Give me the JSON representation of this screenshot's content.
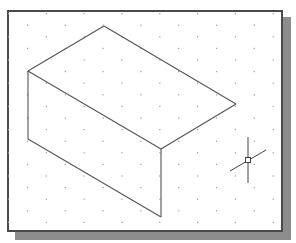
{
  "viewport": {
    "frame": {
      "x": 7,
      "y": 10,
      "width": 276,
      "height": 222,
      "border_color": "#4a4a4a"
    },
    "shadow": {
      "offset_x": 8,
      "offset_y": 7,
      "color": "#8c8c8c"
    },
    "background": "#ffffff"
  },
  "grid": {
    "type": "isometric-snap-grid",
    "origin_x": 8,
    "origin_y": 13,
    "column_spacing": 18.9,
    "row_spacing": 23.2,
    "stagger": 11.6,
    "dot_color": "#9a9a9a"
  },
  "drawing": {
    "object": "isometric-box-wireframe",
    "line_color": "#555555",
    "vertices": {
      "top_back": [
        104,
        26
      ],
      "left_top": [
        28,
        71
      ],
      "right_top": [
        236,
        104
      ],
      "front_top": [
        161,
        149
      ],
      "left_bottom": [
        28,
        139
      ],
      "front_bottom": [
        161,
        217
      ]
    },
    "edges": [
      [
        "left_top",
        "top_back"
      ],
      [
        "top_back",
        "right_top"
      ],
      [
        "right_top",
        "front_top"
      ],
      [
        "left_top",
        "front_top"
      ],
      [
        "left_top",
        "left_bottom"
      ],
      [
        "left_bottom",
        "front_bottom"
      ],
      [
        "front_top",
        "front_bottom"
      ]
    ]
  },
  "cursor": {
    "type": "isometric-crosshair",
    "center": [
      248,
      160
    ],
    "vertical": {
      "y1": 137,
      "y2": 183
    },
    "isometric_axis": {
      "x1": 230,
      "y1": 171,
      "x2": 266,
      "y2": 150
    },
    "pickbox_size": 5,
    "color": "#444444"
  }
}
